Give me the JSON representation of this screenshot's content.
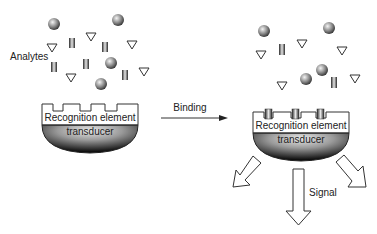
{
  "diagram": {
    "left": {
      "analytes_label": "Analytes",
      "recognition_label": "Recognition element",
      "transducer_label": "transducer"
    },
    "arrow": {
      "label": "Binding"
    },
    "right": {
      "recognition_label": "Recognition element",
      "transducer_label": "transducer",
      "signal_label": "Signal"
    },
    "colors": {
      "outline": "#333333",
      "sphere_light": "#f2f2f2",
      "sphere_dark": "#333333",
      "transducer_dark": "#111111",
      "transducer_light": "#d8d8d8"
    }
  }
}
